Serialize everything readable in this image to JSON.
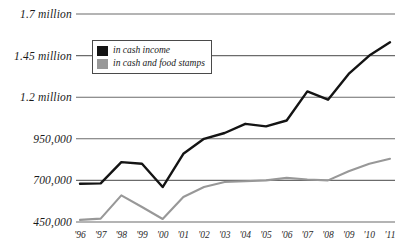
{
  "chart_data": {
    "type": "line",
    "title": "",
    "xlabel": "",
    "ylabel": "",
    "grid": true,
    "legend_position": "top-left-inside",
    "x": [
      "'96",
      "'97",
      "'98",
      "'99",
      "'00",
      "'01",
      "'02",
      "'03",
      "'04",
      "'05",
      "'06",
      "'07",
      "'08",
      "'09",
      "'10",
      "'11"
    ],
    "ylim": [
      450000,
      1700000
    ],
    "yticks": [
      450000,
      700000,
      950000,
      1200000,
      1450000,
      1700000
    ],
    "ytick_labels": [
      "450,000",
      "700,000",
      "950,000",
      "1.2 million",
      "1.45 million",
      "1.7 million"
    ],
    "series": [
      {
        "name": "in cash income",
        "color": "#141414",
        "values": [
          680000,
          682000,
          810000,
          800000,
          660000,
          860000,
          950000,
          985000,
          1040000,
          1025000,
          1060000,
          1235000,
          1185000,
          1340000,
          1450000,
          1530000
        ]
      },
      {
        "name": "in cash and food stamps",
        "color": "#989898",
        "values": [
          463000,
          470000,
          610000,
          540000,
          468000,
          600000,
          660000,
          690000,
          695000,
          700000,
          715000,
          705000,
          700000,
          755000,
          800000,
          830000
        ]
      }
    ]
  },
  "legend": {
    "items": [
      {
        "label": "in cash income",
        "color": "#141414"
      },
      {
        "label": "in cash and food stamps",
        "color": "#989898"
      }
    ]
  }
}
